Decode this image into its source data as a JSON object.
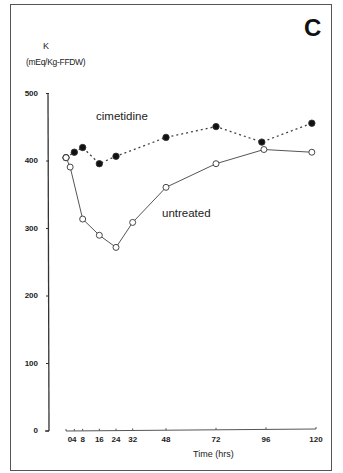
{
  "chart_data": {
    "type": "line",
    "panel_label": "C",
    "title": "",
    "xlabel": "Time (hrs)",
    "ylabel": "K (mEq/Kg-FFDW)",
    "ylabel_line1": "K",
    "ylabel_line2": "(mEq/Kg-FFDW)",
    "xlim": [
      0,
      120
    ],
    "ylim": [
      0,
      500
    ],
    "x_ticks": [
      0,
      4,
      8,
      16,
      24,
      32,
      48,
      72,
      96,
      120
    ],
    "x_tick_labels": [
      "0",
      "4",
      "8",
      "16",
      "24",
      "32",
      "48",
      "72",
      "96",
      "120"
    ],
    "y_ticks": [
      0,
      100,
      200,
      300,
      400,
      500
    ],
    "y_tick_labels": [
      "0",
      "100",
      "200",
      "300",
      "400",
      "500"
    ],
    "grid": false,
    "legend": "inline labels",
    "series": [
      {
        "name": "cimetidine",
        "marker": "filled circle",
        "line": "dotted",
        "x": [
          0,
          4,
          8,
          16,
          24,
          48,
          72,
          94,
          118
        ],
        "values": [
          405,
          413,
          420,
          396,
          407,
          435,
          451,
          428,
          456
        ]
      },
      {
        "name": "untreated",
        "marker": "open circle",
        "line": "solid",
        "x": [
          0,
          2,
          8,
          16,
          24,
          32,
          48,
          72,
          95,
          118
        ],
        "values": [
          405,
          391,
          314,
          290,
          272,
          309,
          361,
          396,
          417,
          413
        ]
      }
    ],
    "annotations": [
      "cimetidine",
      "untreated"
    ]
  }
}
